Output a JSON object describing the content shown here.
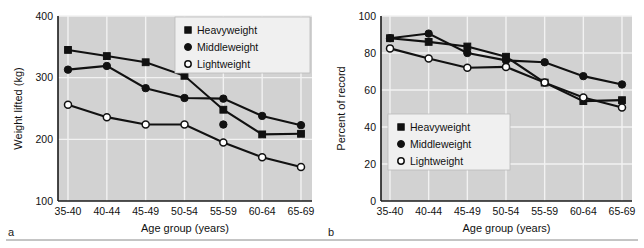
{
  "figure": {
    "panels": [
      {
        "letter": "a",
        "xlabel": "Age group (years)",
        "ylabel": "Weight lifted (kg)"
      },
      {
        "letter": "b",
        "xlabel": "Age group (years)",
        "ylabel": "Percent of record"
      }
    ],
    "legend_labels": [
      "Heavyweight",
      "Middleweight",
      "Lightweight"
    ],
    "legend_markers": [
      "filled-square-marker",
      "filled-circle-marker",
      "open-circle-marker"
    ],
    "colors": {
      "plot_background": "#d2d2d2",
      "gridline": "#f2f2f2",
      "ink": "#111111",
      "legend_background": "#f0f0f0",
      "page_background": "#ffffff"
    }
  },
  "chart_data": [
    {
      "type": "line",
      "panel": "a",
      "title": "",
      "xlabel": "Age group (years)",
      "ylabel": "Weight lifted (kg)",
      "categories": [
        "35-40",
        "40-44",
        "45-49",
        "50-54",
        "55-59",
        "60-64",
        "65-69"
      ],
      "ylim": [
        100,
        400
      ],
      "yticks": [
        100,
        200,
        300,
        400
      ],
      "ytick_labels": [
        "100",
        "200",
        "300",
        "400"
      ],
      "grid": true,
      "legend_position": "top-right",
      "series": [
        {
          "name": "Heavyweight",
          "marker": "filled-square",
          "values": [
            345,
            335,
            325,
            303,
            248,
            208,
            209
          ]
        },
        {
          "name": "Middleweight",
          "marker": "filled-circle",
          "values": [
            313,
            319,
            283,
            267,
            266,
            238,
            223
          ]
        },
        {
          "name": "Lightweight",
          "marker": "open-circle",
          "values": [
            256,
            236,
            224,
            224,
            195,
            171,
            155
          ]
        }
      ],
      "extra_points": [
        {
          "series": "Middleweight",
          "category": "55-59",
          "value": 224,
          "marker": "filled-circle"
        }
      ]
    },
    {
      "type": "line",
      "panel": "b",
      "title": "",
      "xlabel": "Age group (years)",
      "ylabel": "Percent of record",
      "categories": [
        "35-40",
        "40-44",
        "45-49",
        "50-54",
        "55-59",
        "60-64",
        "65-69"
      ],
      "ylim": [
        0,
        100
      ],
      "yticks": [
        0,
        20,
        40,
        60,
        80,
        100
      ],
      "ytick_labels": [
        "0",
        "20",
        "40",
        "60",
        "80",
        "100"
      ],
      "grid": true,
      "legend_position": "lower-left",
      "series": [
        {
          "name": "Heavyweight",
          "marker": "filled-square",
          "values": [
            88,
            86,
            83.5,
            78,
            64,
            54,
            54.5
          ]
        },
        {
          "name": "Middleweight",
          "marker": "filled-circle",
          "values": [
            88,
            90.5,
            80,
            76,
            75,
            67.5,
            63
          ]
        },
        {
          "name": "Lightweight",
          "marker": "open-circle",
          "values": [
            82.5,
            77,
            72,
            72.5,
            64,
            56,
            50.5
          ]
        }
      ],
      "extra_points": []
    }
  ]
}
